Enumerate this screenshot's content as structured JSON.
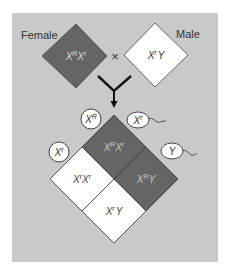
{
  "parents": {
    "female": {
      "label": "Female",
      "genotype": {
        "a": "X",
        "a_sup": "R",
        "b": "X",
        "b_sup": "r"
      },
      "color": "#656565"
    },
    "cross_symbol": "×",
    "male": {
      "label": "Male",
      "genotype": {
        "a": "X",
        "a_sup": "r",
        "b": "Y",
        "b_sup": ""
      },
      "color": "#ffffff"
    }
  },
  "gametes": {
    "eggs": [
      {
        "base": "X",
        "sup": "R"
      },
      {
        "base": "X",
        "sup": "r"
      }
    ],
    "sperm": [
      {
        "base": "X",
        "sup": "r"
      },
      {
        "base": "Y",
        "sup": ""
      }
    ]
  },
  "punnett": {
    "cells": [
      {
        "a": "X",
        "a_sup": "R",
        "b": "X",
        "b_sup": "r",
        "color": "#656565"
      },
      {
        "a": "X",
        "a_sup": "R",
        "b": "Y",
        "b_sup": "",
        "color": "#656565"
      },
      {
        "a": "X",
        "a_sup": "r",
        "b": "X",
        "b_sup": "r",
        "color": "#ffffff"
      },
      {
        "a": "X",
        "a_sup": "r",
        "b": "Y",
        "b_sup": "",
        "color": "#ffffff"
      }
    ]
  },
  "colors": {
    "background": "#c9c9c9",
    "dark": "#656565",
    "light": "#ffffff",
    "line": "#222222"
  }
}
